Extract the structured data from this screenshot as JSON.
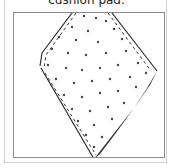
{
  "instruction": {
    "caption": "cushion pad."
  },
  "figure": {
    "colors": {
      "outline": "#222222",
      "dots": "#444444",
      "shade": "#333333",
      "frame": "#8a8a8a",
      "card_border": "#cfcfcf"
    }
  }
}
